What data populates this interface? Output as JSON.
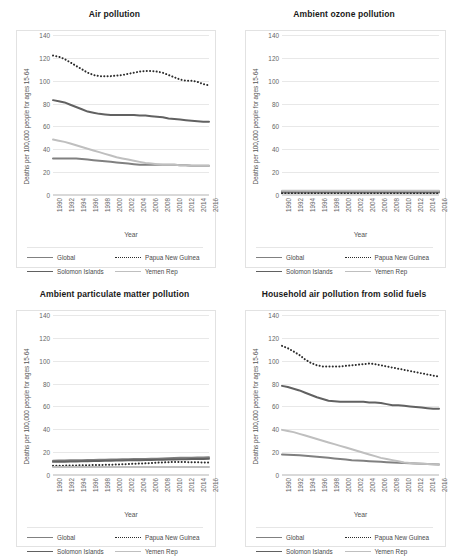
{
  "axis": {
    "ylabel": "Deaths per 100,000 people for ages 15-64",
    "xlabel": "Year",
    "yticks": [
      "0",
      "20",
      "40",
      "60",
      "80",
      "100",
      "120",
      "140"
    ],
    "xticks": [
      "1990",
      "1992",
      "1994",
      "1996",
      "1998",
      "2000",
      "2002",
      "2004",
      "2006",
      "2008",
      "2010",
      "2012",
      "2014",
      "2016"
    ]
  },
  "colors": {
    "global": "#808080",
    "papua_new_guinea": "#2b2b2b",
    "solomon_islands": "#616161",
    "yemen_rep": "#bfbfbf",
    "gridline": "#e8e8e8",
    "text": "#595959"
  },
  "legend": {
    "items": [
      {
        "label": "Global",
        "style": "solid",
        "color": "#808080"
      },
      {
        "label": "Papua New Guinea",
        "style": "dotted",
        "color": "#2b2b2b"
      },
      {
        "label": "Solomon Islands",
        "style": "solid",
        "color": "#616161"
      },
      {
        "label": "Yemen Rep",
        "style": "solid",
        "color": "#bfbfbf"
      }
    ]
  },
  "panels": [
    {
      "id": "air-pollution",
      "title": "Air pollution"
    },
    {
      "id": "ambient-ozone-pollution",
      "title": "Ambient ozone pollution"
    },
    {
      "id": "ambient-particulate-matter-pollution",
      "title": "Ambient particulate matter pollution"
    },
    {
      "id": "household-air-pollution-from-solid-fuels",
      "title": "Household air pollution from solid fuels"
    }
  ],
  "chart_data": [
    {
      "type": "line",
      "title": "Air pollution",
      "xlabel": "Year",
      "ylabel": "Deaths per 100,000 people for ages 15-64",
      "ylim": [
        0,
        140
      ],
      "grid": true,
      "legend_position": "bottom",
      "x": [
        1990,
        1991,
        1992,
        1993,
        1994,
        1995,
        1996,
        1997,
        1998,
        1999,
        2000,
        2001,
        2002,
        2003,
        2004,
        2005,
        2006,
        2007,
        2008,
        2009,
        2010,
        2011,
        2012,
        2013,
        2014,
        2015,
        2016,
        2017
      ],
      "series": [
        {
          "name": "Global",
          "style": "solid",
          "values": [
            32,
            32,
            32,
            32,
            32,
            31.5,
            31,
            30.5,
            30,
            29.5,
            29,
            28.5,
            28,
            27.5,
            27,
            26.5,
            26.5,
            26.5,
            26.5,
            26.5,
            26.5,
            26.5,
            26,
            26,
            25.5,
            25.5,
            25.5,
            25.5
          ]
        },
        {
          "name": "Papua New Guinea",
          "style": "dotted",
          "values": [
            122,
            121,
            119,
            116,
            113,
            110,
            107,
            105,
            104,
            104,
            104,
            104.5,
            105,
            106,
            107,
            108,
            108.5,
            108.5,
            108,
            107,
            105,
            103,
            101,
            100,
            100,
            99,
            97,
            96
          ]
        },
        {
          "name": "Solomon Islands",
          "style": "solid",
          "values": [
            83,
            82,
            81,
            79,
            77,
            75,
            73,
            72,
            71,
            70.5,
            70,
            70,
            70,
            70,
            70,
            69.5,
            69.5,
            69,
            68.5,
            68,
            67,
            66.5,
            66,
            65.5,
            65,
            64.5,
            64,
            64
          ]
        },
        {
          "name": "Yemen Rep",
          "style": "solid",
          "values": [
            48.5,
            47.5,
            46.5,
            45,
            43.5,
            42,
            40.5,
            39,
            37.5,
            36,
            34.5,
            33,
            32,
            31,
            30,
            29,
            28,
            27.5,
            27,
            26.5,
            26.5,
            26.5,
            26,
            26,
            25.5,
            25.5,
            25.5,
            25.5
          ]
        }
      ]
    },
    {
      "type": "line",
      "title": "Ambient ozone pollution",
      "xlabel": "Year",
      "ylabel": "Deaths per 100,000 people for ages 15-64",
      "ylim": [
        0,
        140
      ],
      "grid": true,
      "legend_position": "bottom",
      "x": [
        1990,
        1991,
        1992,
        1993,
        1994,
        1995,
        1996,
        1997,
        1998,
        1999,
        2000,
        2001,
        2002,
        2003,
        2004,
        2005,
        2006,
        2007,
        2008,
        2009,
        2010,
        2011,
        2012,
        2013,
        2014,
        2015,
        2016,
        2017
      ],
      "series": [
        {
          "name": "Global",
          "style": "solid",
          "values": [
            2.2,
            2.2,
            2.2,
            2.2,
            2.2,
            2.2,
            2.2,
            2.2,
            2.2,
            2.2,
            2.2,
            2.2,
            2.2,
            2.2,
            2.2,
            2.2,
            2.2,
            2.2,
            2.2,
            2.2,
            2.2,
            2.2,
            2.2,
            2.2,
            2.2,
            2.2,
            2.2,
            2.2
          ]
        },
        {
          "name": "Papua New Guinea",
          "style": "dotted",
          "values": [
            1.5,
            1.5,
            1.5,
            1.5,
            1.5,
            1.5,
            1.5,
            1.5,
            1.5,
            1.5,
            1.5,
            1.5,
            1.5,
            1.5,
            1.5,
            1.5,
            1.5,
            1.5,
            1.5,
            1.5,
            1.5,
            1.5,
            1.5,
            1.5,
            1.5,
            1.5,
            1.5,
            1.5
          ]
        },
        {
          "name": "Solomon Islands",
          "style": "solid",
          "values": [
            3.2,
            3.2,
            3.2,
            3.2,
            3.2,
            3.2,
            3.1,
            3.1,
            3.1,
            3.1,
            3.1,
            3.1,
            3.1,
            3.1,
            3.1,
            3.1,
            3.1,
            3.1,
            3.1,
            3.1,
            3.0,
            3.0,
            3.0,
            3.0,
            3.0,
            3.0,
            3.0,
            3.0
          ]
        },
        {
          "name": "Yemen Rep",
          "style": "solid",
          "values": [
            3.8,
            3.8,
            3.8,
            3.8,
            3.8,
            3.8,
            3.8,
            3.8,
            3.8,
            3.8,
            3.8,
            3.8,
            3.8,
            3.8,
            3.8,
            3.8,
            3.8,
            3.8,
            3.7,
            3.7,
            3.7,
            3.7,
            3.7,
            3.7,
            3.7,
            3.7,
            3.7,
            3.7
          ]
        }
      ]
    },
    {
      "type": "line",
      "title": "Ambient particulate matter pollution",
      "xlabel": "Year",
      "ylabel": "Deaths per 100,000 people for ages 15-64",
      "ylim": [
        0,
        140
      ],
      "grid": true,
      "legend_position": "bottom",
      "x": [
        1990,
        1991,
        1992,
        1993,
        1994,
        1995,
        1996,
        1997,
        1998,
        1999,
        2000,
        2001,
        2002,
        2003,
        2004,
        2005,
        2006,
        2007,
        2008,
        2009,
        2010,
        2011,
        2012,
        2013,
        2014,
        2015,
        2016,
        2017
      ],
      "series": [
        {
          "name": "Global",
          "style": "solid",
          "values": [
            12.5,
            12.6,
            12.7,
            12.8,
            12.9,
            13.0,
            13.1,
            13.2,
            13.3,
            13.4,
            13.5,
            13.6,
            13.7,
            13.8,
            13.9,
            14.0,
            14.1,
            14.2,
            14.3,
            14.4,
            14.6,
            14.8,
            15.0,
            15.1,
            15.2,
            15.3,
            15.4,
            15.5
          ]
        },
        {
          "name": "Papua New Guinea",
          "style": "dotted",
          "values": [
            8.0,
            8.1,
            8.2,
            8.3,
            8.4,
            8.5,
            8.6,
            8.7,
            8.8,
            8.9,
            9.0,
            9.2,
            9.4,
            9.6,
            9.8,
            10.0,
            10.2,
            10.5,
            10.8,
            11.0,
            11.2,
            11.4,
            11.4,
            11.3,
            11.2,
            11.1,
            11.0,
            11.0
          ]
        },
        {
          "name": "Solomon Islands",
          "style": "solid",
          "values": [
            11.5,
            11.6,
            11.7,
            11.8,
            11.9,
            12.0,
            12.1,
            12.2,
            12.3,
            12.4,
            12.5,
            12.6,
            12.7,
            12.8,
            12.9,
            13.0,
            13.1,
            13.2,
            13.3,
            13.4,
            13.5,
            13.6,
            13.7,
            13.8,
            13.9,
            14.0,
            14.1,
            14.2
          ]
        },
        {
          "name": "Yemen Rep",
          "style": "solid",
          "values": [
            7.0,
            7.0,
            7.0,
            7.0,
            7.0,
            7.0,
            7.0,
            7.0,
            7.0,
            7.0,
            7.0,
            7.0,
            7.0,
            7.0,
            7.0,
            7.0,
            7.0,
            7.0,
            7.0,
            7.0,
            7.0,
            7.0,
            7.0,
            7.0,
            7.0,
            7.0,
            7.0,
            7.0
          ]
        }
      ]
    },
    {
      "type": "line",
      "title": "Household air pollution from solid fuels",
      "xlabel": "Year",
      "ylabel": "Deaths per 100,000 people for ages 15-64",
      "ylim": [
        0,
        140
      ],
      "grid": true,
      "legend_position": "bottom",
      "x": [
        1990,
        1991,
        1992,
        1993,
        1994,
        1995,
        1996,
        1997,
        1998,
        1999,
        2000,
        2001,
        2002,
        2003,
        2004,
        2005,
        2006,
        2007,
        2008,
        2009,
        2010,
        2011,
        2012,
        2013,
        2014,
        2015,
        2016,
        2017
      ],
      "series": [
        {
          "name": "Global",
          "style": "solid",
          "values": [
            18,
            17.8,
            17.5,
            17.2,
            16.8,
            16.4,
            16,
            15.5,
            15,
            14.5,
            14,
            13.5,
            13,
            12.7,
            12.4,
            12.1,
            11.8,
            11.5,
            11.2,
            11,
            10.8,
            10.5,
            10.2,
            10,
            9.8,
            9.6,
            9.4,
            9.2
          ]
        },
        {
          "name": "Papua New Guinea",
          "style": "dotted",
          "values": [
            113,
            111,
            108,
            105,
            101,
            98,
            96,
            95,
            95,
            95,
            95,
            95.5,
            96,
            96.5,
            97,
            97.5,
            97,
            96,
            95,
            94,
            93,
            92,
            91,
            90,
            89,
            88,
            87,
            86
          ]
        },
        {
          "name": "Solomon Islands",
          "style": "solid",
          "values": [
            78,
            77,
            75.5,
            74,
            72,
            70,
            68,
            66.5,
            65,
            64.5,
            64,
            64,
            64,
            64,
            64,
            63.5,
            63.5,
            63,
            62,
            61,
            61,
            60.5,
            60,
            59.5,
            59,
            58.5,
            58,
            58
          ]
        },
        {
          "name": "Yemen Rep",
          "style": "solid",
          "values": [
            39.5,
            38.5,
            37.5,
            36,
            34.5,
            33,
            31.5,
            30,
            28.5,
            27,
            25.5,
            24,
            22.5,
            21,
            19.5,
            18,
            16.5,
            15,
            14,
            13,
            12,
            11,
            10.5,
            10,
            9.8,
            9.6,
            9.4,
            9.2
          ]
        }
      ]
    }
  ]
}
